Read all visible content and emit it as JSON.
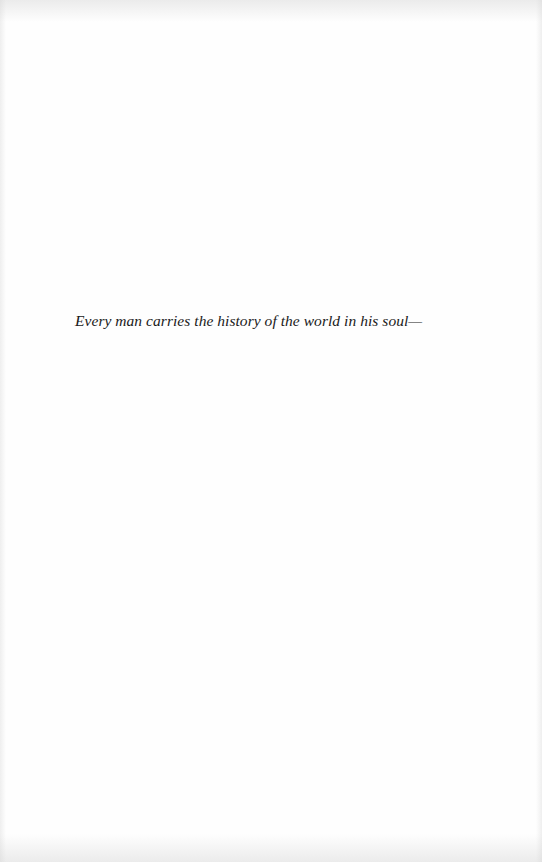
{
  "page": {
    "epigraph": "Every man carries the history of the world in his soul—"
  }
}
